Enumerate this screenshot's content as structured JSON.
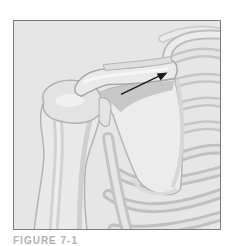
{
  "figure": {
    "arrow": {
      "from": [
        108,
        74
      ],
      "to": [
        153,
        53
      ],
      "color": "#1a1a1a"
    },
    "colors": {
      "background": "#e6e6e6",
      "bone_light": "#ededed",
      "bone_mid": "#d4d4d4",
      "shadow": "#bdbdbd",
      "outline": "#a8a8a8",
      "frame": "#7d7d7d"
    }
  },
  "caption": {
    "text": "FIGURE 7-1"
  }
}
